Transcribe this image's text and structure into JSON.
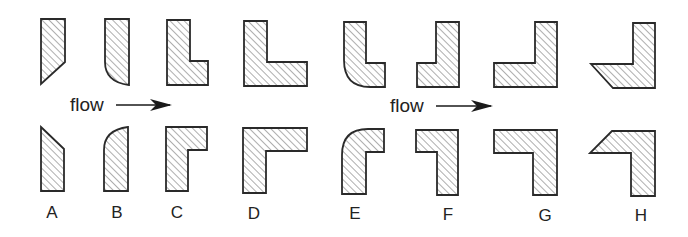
{
  "diagram": {
    "title": "",
    "colors": {
      "outline": "#2a2a2a",
      "hatch": "#6a6a6a",
      "background": "#ffffff",
      "text": "#222222"
    },
    "flow_labels": [
      {
        "text": "flow",
        "arrow": "right"
      },
      {
        "text": "flow",
        "arrow": "right"
      }
    ],
    "shape_labels": [
      "A",
      "B",
      "C",
      "D",
      "E",
      "F",
      "G",
      "H"
    ],
    "columns": [
      {
        "label": "A",
        "top": "wedge-bar (angled bottom)",
        "bottom": "wedge-bar (angled top)"
      },
      {
        "label": "B",
        "top": "bar with rounded bottom-left",
        "bottom": "bar with rounded top-left"
      },
      {
        "label": "C",
        "top": "small L",
        "bottom": "small L (mirrored vertically)"
      },
      {
        "label": "D",
        "top": "wide L",
        "bottom": "wide L (mirrored vertically)"
      },
      {
        "label": "E",
        "top": "L with rounded outer corner",
        "bottom": "L with rounded outer corner (mirrored)"
      },
      {
        "label": "F",
        "top": "reverse small L",
        "bottom": "reverse small L (mirrored)"
      },
      {
        "label": "G",
        "top": "reverse wide L",
        "bottom": "reverse wide L (mirrored)"
      },
      {
        "label": "H",
        "top": "reverse L with chamfered tip",
        "bottom": "reverse L with chamfered tip (mirrored)"
      }
    ]
  }
}
